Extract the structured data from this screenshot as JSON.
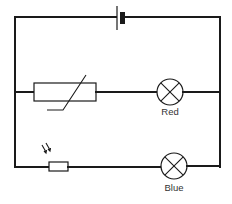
{
  "diagram": {
    "type": "circuit",
    "components": {
      "battery": {
        "name": "cell"
      },
      "thermistor": {
        "name": "thermistor"
      },
      "ldr": {
        "name": "light-dependent-resistor"
      },
      "lamp_red": {
        "name": "lamp",
        "label": "Red"
      },
      "lamp_blue": {
        "name": "lamp",
        "label": "Blue"
      }
    },
    "branches": [
      {
        "id": "top",
        "components": [
          "battery"
        ]
      },
      {
        "id": "middle",
        "components": [
          "thermistor",
          "lamp_red"
        ]
      },
      {
        "id": "bottom",
        "components": [
          "ldr",
          "lamp_blue"
        ]
      }
    ],
    "colors": {
      "line": "#1a1a1a",
      "label": "#333333",
      "background": "#ffffff"
    }
  }
}
